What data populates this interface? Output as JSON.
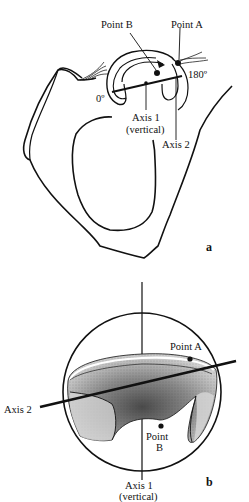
{
  "figure_a": {
    "panel_label": "a",
    "labels": {
      "point_b": "Point B",
      "point_a": "Point A",
      "angle_180": "180º",
      "angle_0": "0º",
      "axis1_line1": "Axis 1",
      "axis1_line2": "(vertical)",
      "axis2": "Axis 2"
    }
  },
  "figure_b": {
    "panel_label": "b",
    "labels": {
      "point_a": "Point A",
      "axis2": "Axis 2",
      "point_b_line1": "Point",
      "point_b_line2": "B",
      "axis1_line1": "Axis 1",
      "axis1_line2": "(vertical)"
    }
  },
  "colors": {
    "ink": "#111111",
    "background": "#ffffff",
    "stipple_dark": "#555555",
    "stipple_light": "#bdbdbd"
  }
}
